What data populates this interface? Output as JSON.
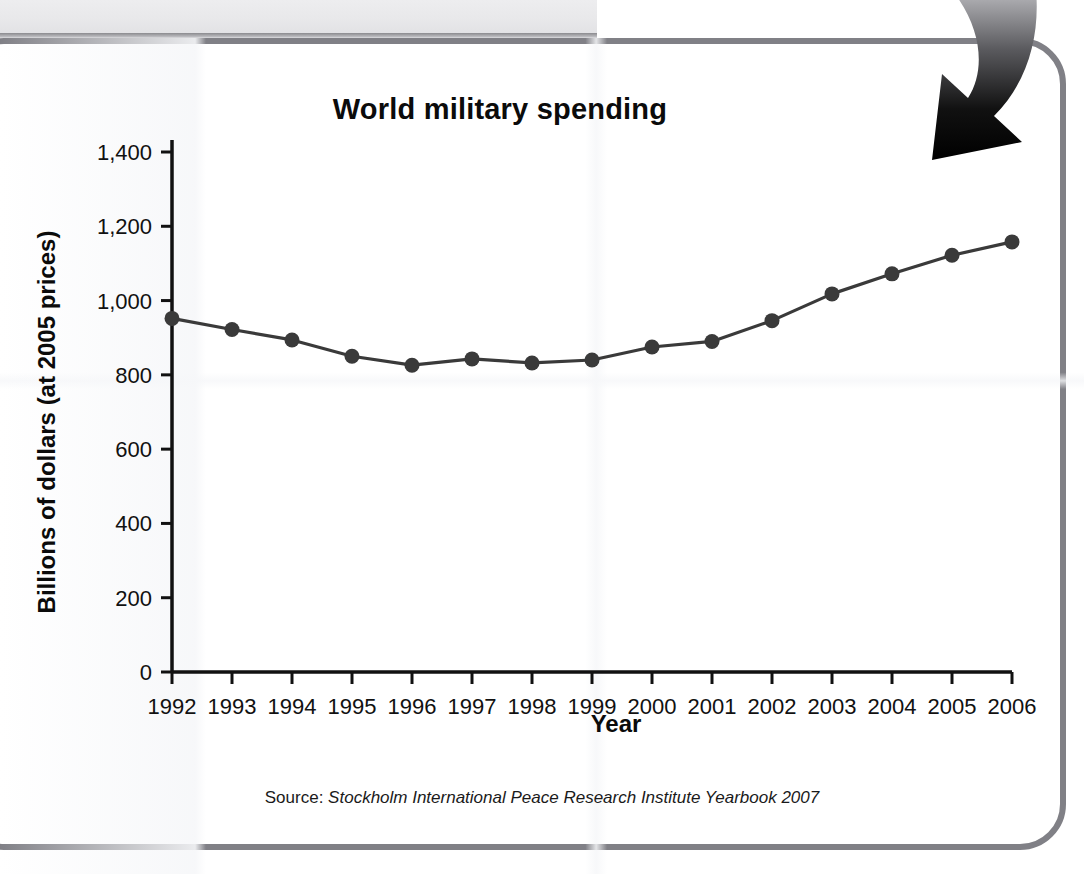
{
  "decor": {
    "top_band_name": "gray-header-band",
    "arrow_name": "curved-down-arrow",
    "frame_color": "#808086",
    "band_color": "#e8e8ea"
  },
  "figure": {
    "title": "World military spending",
    "source_label": "Source:",
    "source_title": "Stockholm International Peace Research Institute Yearbook 2007"
  },
  "chart_data": {
    "type": "line",
    "title": "World military spending",
    "xlabel": "Year",
    "ylabel": "Billions of dollars (at 2005 prices)",
    "categories": [
      "1992",
      "1993",
      "1994",
      "1995",
      "1996",
      "1997",
      "1998",
      "1999",
      "2000",
      "2001",
      "2002",
      "2003",
      "2004",
      "2005",
      "2006"
    ],
    "x": [
      1992,
      1993,
      1994,
      1995,
      1996,
      1997,
      1998,
      1999,
      2000,
      2001,
      2002,
      2003,
      2004,
      2005,
      2006
    ],
    "values": [
      952,
      922,
      894,
      850,
      826,
      843,
      832,
      840,
      875,
      890,
      946,
      1018,
      1072,
      1122,
      1158
    ],
    "series": [
      {
        "name": "World military spending",
        "values": [
          952,
          922,
          894,
          850,
          826,
          843,
          832,
          840,
          875,
          890,
          946,
          1018,
          1072,
          1122,
          1158
        ]
      }
    ],
    "ylim": [
      0,
      1400
    ],
    "ytick_step": 200,
    "ytick_labels": [
      "0",
      "200",
      "400",
      "600",
      "800",
      "1,000",
      "1,200",
      "1,400"
    ],
    "ytick_values": [
      0,
      200,
      400,
      600,
      800,
      1000,
      1200,
      1400
    ],
    "xtick_labels": [
      "1992",
      "1993",
      "1994",
      "1995",
      "1996",
      "1997",
      "1998",
      "1999",
      "2000",
      "2001",
      "2002",
      "2003",
      "2004",
      "2005",
      "2006"
    ],
    "grid": false,
    "legend": "none",
    "line_color": "#3a3a3a",
    "marker_color": "#3a3a3a",
    "marker_shape": "circle",
    "axis_color": "#111111"
  }
}
